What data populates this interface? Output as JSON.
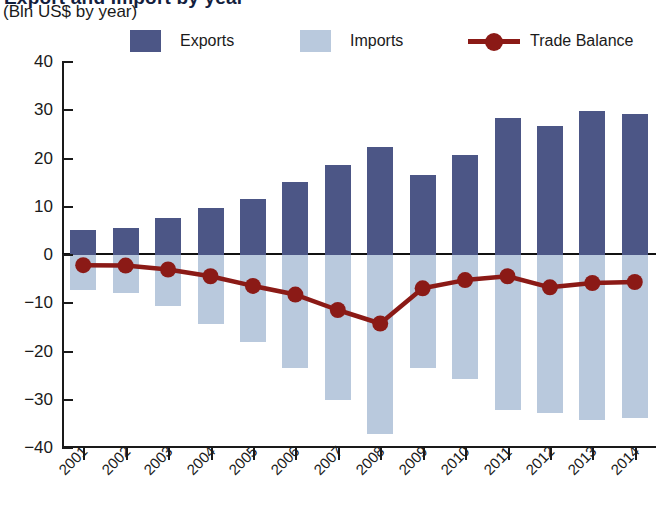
{
  "header": {
    "title_clipped": "Export and Import by year",
    "subtitle": "(Bln US$ by year)"
  },
  "legend": {
    "items": [
      {
        "label": "Exports",
        "type": "swatch",
        "color": "#4c5686"
      },
      {
        "label": "Imports",
        "type": "swatch",
        "color": "#b9c9dd"
      },
      {
        "label": "Trade Balance",
        "type": "line-marker",
        "color": "#8b1a16"
      }
    ]
  },
  "chart_data": {
    "type": "bar",
    "title": "Export and Import by year",
    "subtitle": "(Bln US$ by year)",
    "xlabel": "",
    "ylabel": "Bln US$",
    "ylim": [
      -40,
      40
    ],
    "yticks": [
      40,
      30,
      20,
      10,
      0,
      -10,
      -20,
      -30,
      -40
    ],
    "ytick_labels": [
      "40",
      "30",
      "20",
      "10",
      "0",
      "−10",
      "−20",
      "−30",
      "−40"
    ],
    "grid": false,
    "legend_position": "top",
    "categories": [
      "2001",
      "2002",
      "2003",
      "2004",
      "2005",
      "2006",
      "2007",
      "2008",
      "2009",
      "2010",
      "2011",
      "2012",
      "2013",
      "2014"
    ],
    "series": [
      {
        "name": "Exports",
        "type": "bar",
        "color": "#4c5686",
        "values": [
          5.2,
          5.6,
          7.6,
          9.8,
          11.7,
          15.2,
          18.7,
          22.4,
          16.6,
          20.7,
          28.3,
          26.7,
          29.8,
          29.3
        ]
      },
      {
        "name": "Imports",
        "type": "bar",
        "color": "#b9c9dd",
        "values": [
          -7.3,
          -7.8,
          -10.6,
          -14.3,
          -18.1,
          -23.4,
          -30.1,
          -37.2,
          -23.4,
          -25.8,
          -32.1,
          -32.7,
          -34.2,
          -33.8
        ]
      },
      {
        "name": "Trade Balance",
        "type": "line",
        "color": "#8b1a16",
        "values": [
          -2.1,
          -2.2,
          -3.0,
          -4.4,
          -6.4,
          -8.2,
          -11.4,
          -14.2,
          -6.9,
          -5.2,
          -4.4,
          -6.7,
          -5.8,
          -5.6
        ]
      }
    ]
  }
}
